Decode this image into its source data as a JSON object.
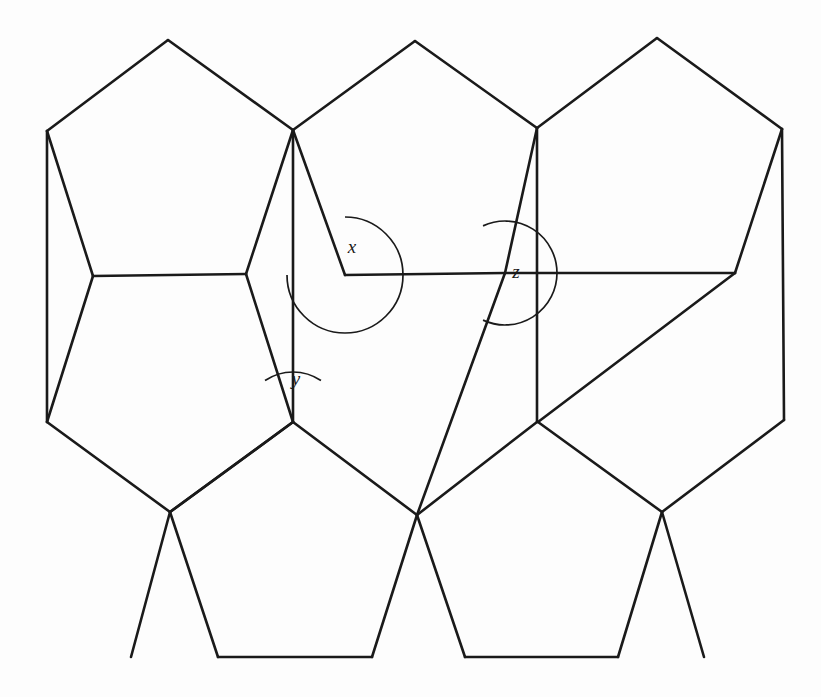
{
  "figure": {
    "background_color": "#fdfdfd",
    "line_color": "#1a1a1a",
    "line_width": 2.6,
    "width": 821,
    "height": 697
  },
  "labels": {
    "x": "x",
    "y": "y",
    "z": "z"
  },
  "chart_data": {
    "type": "diagram",
    "subtype": "pentagon-tiling",
    "xlabel": "",
    "ylabel": "",
    "grid": false,
    "legend": false,
    "vertices": {
      "A": [
        168,
        40
      ],
      "B": [
        47,
        131
      ],
      "C": [
        293,
        130
      ],
      "D": [
        93,
        276
      ],
      "E": [
        246,
        274
      ],
      "F": [
        415,
        41
      ],
      "G": [
        537,
        128
      ],
      "H": [
        345,
        275
      ],
      "I": [
        505,
        273
      ],
      "J": [
        657,
        38
      ],
      "K": [
        782,
        129
      ],
      "L": [
        735,
        273
      ],
      "M": [
        293,
        422
      ],
      "N": [
        47,
        422
      ],
      "O": [
        170,
        512
      ],
      "P": [
        417,
        515
      ],
      "Q": [
        538,
        422
      ],
      "R": [
        784,
        420
      ],
      "S": [
        662,
        512
      ],
      "T": [
        218,
        657
      ],
      "U": [
        372,
        657
      ],
      "V": [
        465,
        657
      ],
      "W": [
        618,
        657
      ],
      "X1": [
        131,
        657
      ],
      "X2": [
        704,
        657
      ]
    },
    "polygons": [
      {
        "name": "top-left-pentagon",
        "points": [
          [
            168,
            40
          ],
          [
            47,
            131
          ],
          [
            93,
            276
          ],
          [
            246,
            274
          ],
          [
            293,
            130
          ]
        ]
      },
      {
        "name": "top-middle-pentagon",
        "points": [
          [
            415,
            41
          ],
          [
            293,
            130
          ],
          [
            345,
            275
          ],
          [
            505,
            273
          ],
          [
            537,
            128
          ]
        ]
      },
      {
        "name": "top-right-pentagon",
        "points": [
          [
            657,
            38
          ],
          [
            537,
            128
          ],
          [
            505,
            273
          ],
          [
            735,
            273
          ],
          [
            782,
            129
          ]
        ]
      },
      {
        "name": "middle-left-pentagon",
        "points": [
          [
            246,
            274
          ],
          [
            293,
            130
          ],
          [
            293,
            422
          ],
          [
            170,
            512
          ],
          [
            93,
            276
          ]
        ]
      },
      {
        "name": "middle-right-pentagon",
        "points": [
          [
            505,
            273
          ],
          [
            537,
            128
          ],
          [
            537,
            422
          ],
          [
            417,
            515
          ],
          [
            345,
            275
          ]
        ]
      },
      {
        "name": "left-lower-pentagon",
        "points": [
          [
            93,
            276
          ],
          [
            47,
            131
          ],
          [
            47,
            422
          ],
          [
            170,
            512
          ],
          [
            93,
            276
          ]
        ]
      },
      {
        "name": "right-lower-pentagon",
        "points": [
          [
            735,
            273
          ],
          [
            782,
            129
          ],
          [
            784,
            420
          ],
          [
            662,
            512
          ],
          [
            538,
            422
          ]
        ]
      },
      {
        "name": "bottom-middle-pentagon",
        "points": [
          [
            293,
            422
          ],
          [
            417,
            515
          ],
          [
            372,
            657
          ],
          [
            218,
            657
          ],
          [
            170,
            512
          ]
        ]
      },
      {
        "name": "bottom-right-pentagon",
        "points": [
          [
            538,
            422
          ],
          [
            662,
            512
          ],
          [
            618,
            657
          ],
          [
            465,
            657
          ],
          [
            417,
            515
          ]
        ]
      }
    ],
    "edges": [
      [
        [
          168,
          40
        ],
        [
          47,
          131
        ]
      ],
      [
        [
          168,
          40
        ],
        [
          293,
          130
        ]
      ],
      [
        [
          47,
          131
        ],
        [
          93,
          276
        ]
      ],
      [
        [
          93,
          276
        ],
        [
          246,
          274
        ]
      ],
      [
        [
          246,
          274
        ],
        [
          293,
          130
        ]
      ],
      [
        [
          415,
          41
        ],
        [
          293,
          130
        ]
      ],
      [
        [
          415,
          41
        ],
        [
          537,
          128
        ]
      ],
      [
        [
          293,
          130
        ],
        [
          345,
          275
        ]
      ],
      [
        [
          345,
          275
        ],
        [
          505,
          273
        ]
      ],
      [
        [
          505,
          273
        ],
        [
          537,
          128
        ]
      ],
      [
        [
          657,
          38
        ],
        [
          537,
          128
        ]
      ],
      [
        [
          657,
          38
        ],
        [
          782,
          129
        ]
      ],
      [
        [
          782,
          129
        ],
        [
          735,
          273
        ]
      ],
      [
        [
          735,
          273
        ],
        [
          505,
          273
        ]
      ],
      [
        [
          293,
          130
        ],
        [
          293,
          422
        ]
      ],
      [
        [
          246,
          274
        ],
        [
          293,
          422
        ]
      ],
      [
        [
          93,
          276
        ],
        [
          47,
          422
        ]
      ],
      [
        [
          47,
          131
        ],
        [
          47,
          422
        ]
      ],
      [
        [
          47,
          422
        ],
        [
          170,
          512
        ]
      ],
      [
        [
          170,
          512
        ],
        [
          293,
          422
        ]
      ],
      [
        [
          537,
          128
        ],
        [
          537,
          422
        ]
      ],
      [
        [
          505,
          273
        ],
        [
          417,
          515
        ]
      ],
      [
        [
          417,
          515
        ],
        [
          537,
          422
        ]
      ],
      [
        [
          735,
          273
        ],
        [
          538,
          422
        ]
      ],
      [
        [
          538,
          422
        ],
        [
          662,
          512
        ]
      ],
      [
        [
          662,
          512
        ],
        [
          784,
          420
        ]
      ],
      [
        [
          784,
          420
        ],
        [
          782,
          129
        ]
      ],
      [
        [
          293,
          422
        ],
        [
          417,
          515
        ]
      ],
      [
        [
          293,
          422
        ],
        [
          170,
          512
        ]
      ],
      [
        [
          170,
          512
        ],
        [
          218,
          657
        ]
      ],
      [
        [
          218,
          657
        ],
        [
          372,
          657
        ]
      ],
      [
        [
          372,
          657
        ],
        [
          417,
          515
        ]
      ],
      [
        [
          417,
          515
        ],
        [
          465,
          657
        ]
      ],
      [
        [
          465,
          657
        ],
        [
          618,
          657
        ]
      ],
      [
        [
          618,
          657
        ],
        [
          662,
          512
        ]
      ],
      [
        [
          170,
          512
        ],
        [
          131,
          657
        ]
      ],
      [
        [
          662,
          512
        ],
        [
          704,
          657
        ]
      ]
    ],
    "angle_marks": [
      {
        "label": "x",
        "vertex": [
          345,
          275
        ],
        "arc_radius": 58,
        "label_position": [
          352,
          249
        ],
        "description": "Interior angle at the vertex where the top-middle pentagon meets the horizontal edge, opening upward-left."
      },
      {
        "label": "y",
        "vertex": [
          293,
          422
        ],
        "arc_radius": 50,
        "label_position": [
          296,
          381
        ],
        "description": "Narrow angle at the vertex between two pentagons above, opening upward."
      },
      {
        "label": "z",
        "vertex": [
          505,
          273
        ],
        "arc_radius": 52,
        "label_position": [
          516,
          274
        ],
        "description": "Reflex-looking angle on the right side of the vertex where the horizontal edge meets the tiling."
      }
    ]
  }
}
